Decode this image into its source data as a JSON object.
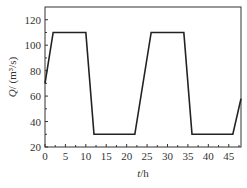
{
  "chart_data": {
    "type": "line",
    "title": "",
    "xlabel": "t/h",
    "xlabel_italic": "t",
    "xlabel_rest": "/h",
    "ylabel": "Q/ (m³/s)",
    "ylabel_italic": "Q",
    "ylabel_rest": "/ (m³/s)",
    "xlim": [
      0,
      48
    ],
    "ylim": [
      20,
      130
    ],
    "xticks": [
      0,
      5,
      10,
      15,
      20,
      25,
      30,
      35,
      40,
      45
    ],
    "yticks": [
      20,
      40,
      60,
      80,
      100,
      120
    ],
    "grid": false,
    "legend": null,
    "series": [
      {
        "name": "Q",
        "x": [
          0,
          2,
          10,
          12,
          22,
          26,
          34,
          36,
          46,
          48
        ],
        "y": [
          70,
          110,
          110,
          30,
          30,
          110,
          110,
          30,
          30,
          58
        ]
      }
    ],
    "colors": {
      "line": "#222222",
      "axes": "#333333"
    }
  }
}
